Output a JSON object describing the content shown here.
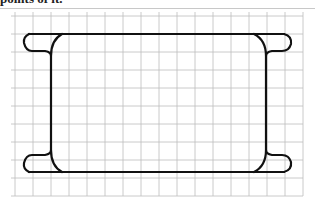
{
  "caption": "points of it.",
  "figure": {
    "grid": {
      "x_start": 15,
      "y_start": 16,
      "spacing": 18,
      "columns": 16,
      "rows": 10,
      "color": "#bdbdbd"
    },
    "shape": {
      "stroke_color": "#111111",
      "rect_left": 51,
      "rect_right": 266,
      "rect_top": 34,
      "rect_bottom": 172
    }
  }
}
